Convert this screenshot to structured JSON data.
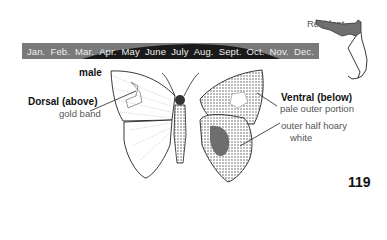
{
  "range_map": {
    "legend_label": "Resident",
    "region": "Florida",
    "shaded_color": "#6f6f6f"
  },
  "flight_period": {
    "months": [
      "Jan.",
      "Feb.",
      "Mar.",
      "Apr.",
      "May",
      "June",
      "July",
      "Aug.",
      "Sept.",
      "Oct.",
      "Nov.",
      "Dec."
    ],
    "band_color": "#7a7a7a",
    "active_color": "#1a1a1a",
    "active_span": "Mar.–Oct."
  },
  "illustration": {
    "sex_label": "male",
    "dorsal": {
      "title": "Dorsal (above)",
      "note": "gold band"
    },
    "ventral": {
      "title": "Ventral (below)",
      "notes": [
        "pale outer portion",
        "outer half hoary",
        "white"
      ]
    }
  },
  "page_number": "119"
}
